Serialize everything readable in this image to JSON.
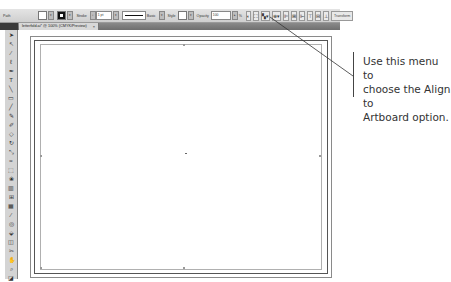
{
  "control_bar": {
    "selection_label": "Path",
    "stroke_label": "Stroke",
    "stroke_weight": "1 pt",
    "brush_label": "Basic",
    "style_label": "Style",
    "opacity_label": "Opacity",
    "opacity_value": "100",
    "opacity_unit": "%",
    "transform_label": "Transform",
    "align_menu_icon": "align-to-artboard-icon"
  },
  "document_tab": {
    "title": "letterfold.ai* @ 100% (CMYK/Preview)",
    "close": "×"
  },
  "tools": [
    "selection-tool",
    "direct-selection-tool",
    "magic-wand-tool",
    "lasso-tool",
    "pen-tool",
    "type-tool",
    "line-tool",
    "rectangle-tool",
    "paintbrush-tool",
    "pencil-tool",
    "blob-brush-tool",
    "eraser-tool",
    "rotate-tool",
    "scale-tool",
    "warp-tool",
    "free-transform-tool",
    "symbol-sprayer-tool",
    "column-graph-tool",
    "mesh-tool",
    "gradient-tool",
    "eyedropper-tool",
    "blend-tool",
    "live-paint-tool",
    "artboard-tool",
    "slice-tool",
    "hand-tool",
    "zoom-tool",
    "fill-stroke-swatches",
    "screen-mode"
  ],
  "annotation": {
    "line1": "Use this menu to",
    "line2": "choose the Align to",
    "line3": "Artboard option."
  }
}
